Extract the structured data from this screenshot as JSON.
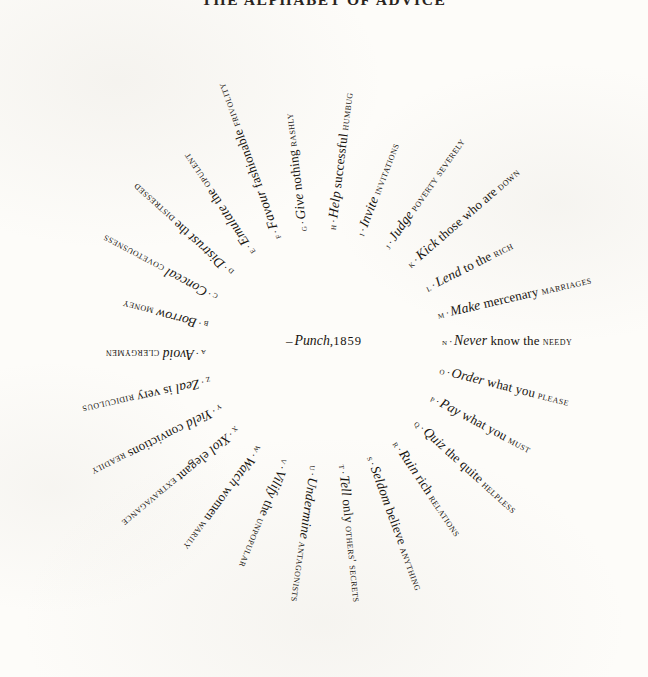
{
  "title": "THE ALPHABET OF ADVICE",
  "credit": {
    "dash": "–",
    "source": "Punch",
    "comma": ",",
    "year": "1859"
  },
  "style": {
    "ink": "#18140f",
    "paper": "#fdfcf9"
  },
  "entries": [
    {
      "letter": "A",
      "verb": "Avoid",
      "mid": "",
      "caps": "CLERGYMEN",
      "angle": 180
    },
    {
      "letter": "B",
      "verb": "Borrow",
      "mid": "",
      "caps": "MONEY",
      "angle": 194
    },
    {
      "letter": "C",
      "verb": "Conceal",
      "mid": "",
      "caps": "COVETOUSNESS",
      "angle": 208
    },
    {
      "letter": "D",
      "verb": "Distrust",
      "mid": "the",
      "caps": "DISTRESSED",
      "angle": 222
    },
    {
      "letter": "E",
      "verb": "Emulate",
      "mid": "the",
      "caps": "OPULENT",
      "angle": 236
    },
    {
      "letter": "F",
      "verb": "Favour",
      "mid": "fashionable",
      "caps": "FRIVOLITY",
      "angle": 250
    },
    {
      "letter": "G",
      "verb": "Give",
      "mid": "nothing",
      "caps": "RASHLY",
      "angle": 263
    },
    {
      "letter": "H",
      "verb": "Help",
      "mid": "successful",
      "caps": "HUMBUG",
      "angle": 277
    },
    {
      "letter": "I",
      "verb": "Invite",
      "mid": "",
      "caps": "INVITATIONS",
      "angle": 291
    },
    {
      "letter": "J",
      "verb": "Judge",
      "mid": "",
      "caps": "POVERTY severely",
      "angle": 305
    },
    {
      "letter": "K",
      "verb": "Kick",
      "mid": "those who are",
      "caps": "DOWN",
      "angle": 319
    },
    {
      "letter": "L",
      "verb": "Lend",
      "mid": "to the",
      "caps": "RICH",
      "angle": 333
    },
    {
      "letter": "M",
      "verb": "Make",
      "mid": "mercenary",
      "caps": "MARRIAGES",
      "angle": 347
    },
    {
      "letter": "N",
      "verb": "Never",
      "mid": "know the",
      "caps": "NEEDY",
      "angle": 0
    },
    {
      "letter": "O",
      "verb": "Order",
      "mid": "what you",
      "caps": "PLEASE",
      "angle": 14
    },
    {
      "letter": "P",
      "verb": "Pay",
      "mid": "what you",
      "caps": "MUST",
      "angle": 28
    },
    {
      "letter": "Q",
      "verb": "Quiz",
      "mid": "the quite",
      "caps": "HELPLESS",
      "angle": 42
    },
    {
      "letter": "R",
      "verb": "Ruin",
      "mid": "rich",
      "caps": "RELATIONS",
      "angle": 56
    },
    {
      "letter": "S",
      "verb": "Seldom",
      "mid": "believe",
      "caps": "ANYTHING",
      "angle": 70
    },
    {
      "letter": "T",
      "verb": "Tell",
      "mid": "only",
      "caps": "OTHERS' SECRETS",
      "angle": 84
    },
    {
      "letter": "U",
      "verb": "Undermine",
      "mid": "",
      "caps": "ANTAGONISTS",
      "angle": 98
    },
    {
      "letter": "V",
      "verb": "Vilify",
      "mid": "the",
      "caps": "UNPOPULAR",
      "angle": 112
    },
    {
      "letter": "W",
      "verb": "Watch",
      "mid": "women",
      "caps": "WARILY",
      "angle": 126
    },
    {
      "letter": "X",
      "verb": "Xtol",
      "mid": "elegant",
      "caps": "EXTRAVAGANCE",
      "angle": 140
    },
    {
      "letter": "Y",
      "verb": "Yield",
      "mid": "convictions",
      "caps": "READILY",
      "angle": 153
    },
    {
      "letter": "Z",
      "verb": "Zeal",
      "mid": "is very",
      "caps": "RIDICULOUS",
      "angle": 167
    }
  ]
}
